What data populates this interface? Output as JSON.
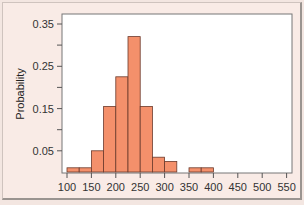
{
  "chart_data": {
    "type": "bar",
    "title": "",
    "xlabel": "",
    "ylabel": "Probability",
    "bin_width": 25,
    "bins": [
      {
        "start": 100,
        "end": 125,
        "value": 0.01
      },
      {
        "start": 125,
        "end": 150,
        "value": 0.01
      },
      {
        "start": 150,
        "end": 175,
        "value": 0.05
      },
      {
        "start": 175,
        "end": 200,
        "value": 0.155
      },
      {
        "start": 200,
        "end": 225,
        "value": 0.225
      },
      {
        "start": 225,
        "end": 250,
        "value": 0.32
      },
      {
        "start": 250,
        "end": 275,
        "value": 0.155
      },
      {
        "start": 275,
        "end": 300,
        "value": 0.035
      },
      {
        "start": 300,
        "end": 325,
        "value": 0.025
      },
      {
        "start": 325,
        "end": 350,
        "value": 0.0
      },
      {
        "start": 350,
        "end": 375,
        "value": 0.01
      },
      {
        "start": 375,
        "end": 400,
        "value": 0.01
      }
    ],
    "categories": [
      "100-125",
      "125-150",
      "150-175",
      "175-200",
      "200-225",
      "225-250",
      "250-275",
      "275-300",
      "300-325",
      "325-350",
      "350-375",
      "375-400"
    ],
    "values": [
      0.01,
      0.01,
      0.05,
      0.155,
      0.225,
      0.32,
      0.155,
      0.035,
      0.025,
      0.0,
      0.01,
      0.01
    ],
    "x_ticks": [
      100,
      150,
      200,
      250,
      300,
      350,
      400,
      450,
      500,
      550
    ],
    "y_ticks_labeled": [
      "0.05",
      "0.15",
      "0.25",
      "0.35"
    ],
    "y_ticks_all": [
      0.05,
      0.1,
      0.15,
      0.2,
      0.25,
      0.3,
      0.35
    ],
    "xlim": [
      90,
      560
    ],
    "ylim": [
      0,
      0.375
    ],
    "grid": false,
    "legend": null,
    "colors": {
      "bar_fill": "#f4906b",
      "bar_edge": "#6b3a2c",
      "plot_bg": "#ffffff",
      "panel_bg": "#f9ebe6"
    }
  }
}
